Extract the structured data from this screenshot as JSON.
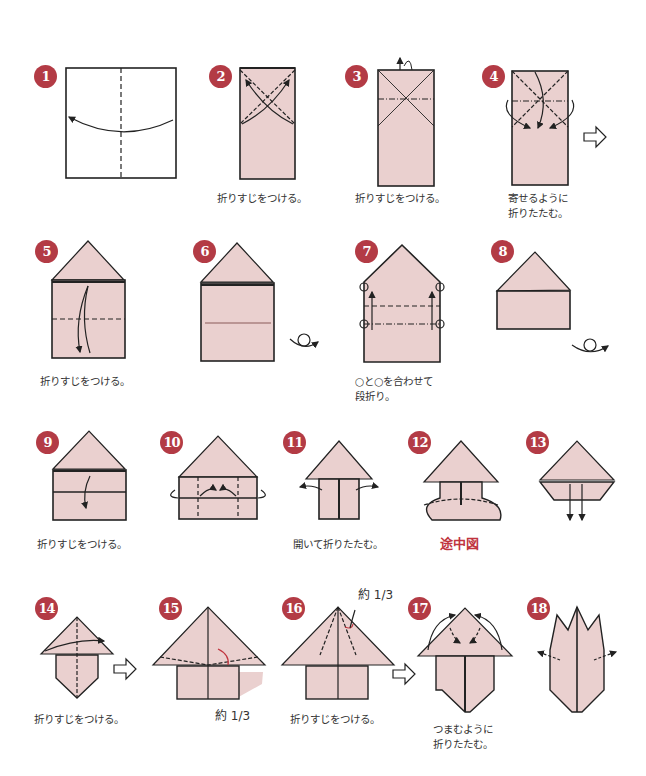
{
  "colors": {
    "paper": "#ead0cf",
    "line": "#222222",
    "badge": "#b33b45",
    "badge_text": "#ffffff",
    "accent_text": "#c0343e",
    "caption": "#333333"
  },
  "steps": [
    {
      "number": "1",
      "caption": ""
    },
    {
      "number": "2",
      "caption": "折りすじをつける。"
    },
    {
      "number": "3",
      "caption": "折りすじをつける。"
    },
    {
      "number": "4",
      "caption_line1": "寄せるように",
      "caption_line2": "折りたたむ。"
    },
    {
      "number": "5",
      "caption": "折りすじをつける。"
    },
    {
      "number": "6",
      "caption": ""
    },
    {
      "number": "7",
      "caption_line1": "○と○を合わせて",
      "caption_line2": "段折り。"
    },
    {
      "number": "8",
      "caption": ""
    },
    {
      "number": "9",
      "caption": "折りすじをつける。"
    },
    {
      "number": "10",
      "caption": ""
    },
    {
      "number": "11",
      "caption": "開いて折りたたむ。"
    },
    {
      "number": "12",
      "caption": "途中図"
    },
    {
      "number": "13",
      "caption": ""
    },
    {
      "number": "14",
      "caption": "折りすじをつける。"
    },
    {
      "number": "15",
      "caption": "",
      "note": "約 1/3"
    },
    {
      "number": "16",
      "caption": "折りすじをつける。",
      "note": "約 1/3"
    },
    {
      "number": "17",
      "caption_line1": "つまむように",
      "caption_line2": "折りたたむ。"
    },
    {
      "number": "18",
      "caption": ""
    }
  ],
  "symbols": {
    "turn_over": "turn-over-symbol",
    "next_arrow": "next-arrow-symbol"
  }
}
